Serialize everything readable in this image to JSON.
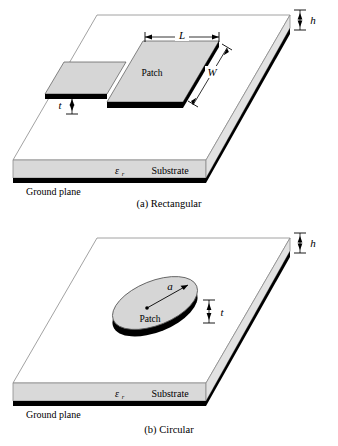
{
  "colors": {
    "substrate_top": "#ffffff",
    "substrate_face": "#d9d9d9",
    "substrate_edge": "#8c8c8c",
    "ground_plane": "#000000",
    "patch_fill": "#d6d6d6",
    "patch_side": "#000000",
    "outline": "#7a7a7a",
    "text": "#000000"
  },
  "figures": [
    {
      "id": "rectangular",
      "caption": "(a) Rectangular",
      "patch_label": "Patch",
      "substrate_label": "Substrate",
      "ground_label": "Ground plane",
      "permittivity_symbol": "ε",
      "permittivity_subscript": "r",
      "dimensions": [
        {
          "name": "length",
          "label": "L"
        },
        {
          "name": "width",
          "label": "W"
        },
        {
          "name": "patch-thickness",
          "label": "t"
        },
        {
          "name": "substrate-height",
          "label": "h"
        }
      ]
    },
    {
      "id": "circular",
      "caption": "(b) Circular",
      "patch_label": "Patch",
      "substrate_label": "Substrate",
      "ground_label": "Ground plane",
      "permittivity_symbol": "ε",
      "permittivity_subscript": "r",
      "dimensions": [
        {
          "name": "radius",
          "label": "a"
        },
        {
          "name": "patch-thickness",
          "label": "t"
        },
        {
          "name": "substrate-height",
          "label": "h"
        }
      ]
    }
  ]
}
